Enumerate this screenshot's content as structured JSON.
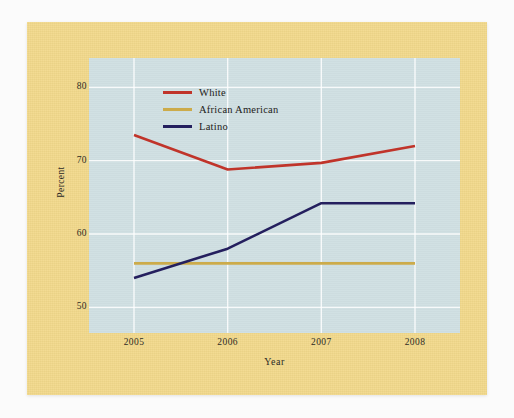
{
  "chart_data": {
    "type": "line",
    "title": "",
    "xlabel": "Year",
    "ylabel": "Percent",
    "categories": [
      "2005",
      "2006",
      "2007",
      "2008"
    ],
    "x": [
      2005,
      2006,
      2007,
      2008
    ],
    "xlim": [
      2005,
      2008
    ],
    "ylim": [
      46.5,
      84
    ],
    "yticks": [
      50,
      60,
      70,
      80
    ],
    "ytick_labels": [
      "50",
      "60",
      "70",
      "80"
    ],
    "xticks": [
      2005,
      2006,
      2007,
      2008
    ],
    "xtick_labels": [
      "2005",
      "2006",
      "2007",
      "2008"
    ],
    "grid": true,
    "grid_color": "#ffffff",
    "legend_position": "upper-center",
    "plot_background": "#cfdfe2",
    "page_background": "#f3d98b",
    "series": [
      {
        "name": "White",
        "color": "#c0342a",
        "values": [
          73.5,
          68.8,
          69.7,
          72.0
        ]
      },
      {
        "name": "African American",
        "color": "#ccab4a",
        "values": [
          56.0,
          56.0,
          56.0,
          56.0
        ]
      },
      {
        "name": "Latino",
        "color": "#241f5e",
        "values": [
          54.0,
          58.0,
          64.2,
          64.2
        ]
      }
    ]
  },
  "legend": {
    "items": [
      {
        "label": "White",
        "color": "#c0342a"
      },
      {
        "label": "African American",
        "color": "#ccab4a"
      },
      {
        "label": "Latino",
        "color": "#241f5e"
      }
    ]
  },
  "axes": {
    "x_title": "Year",
    "y_title": "Percent"
  }
}
